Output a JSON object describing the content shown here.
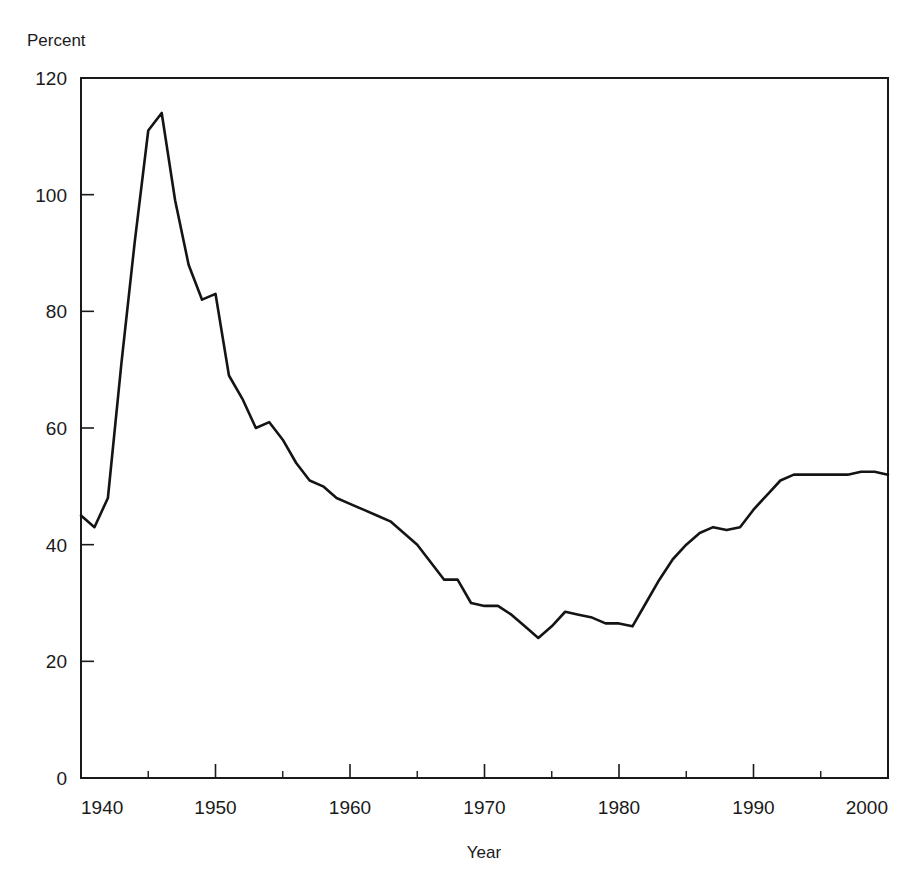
{
  "figure": {
    "ylabel_top": "Percent",
    "xlabel": "Year",
    "background_color": "#ffffff",
    "line_color": "#141414",
    "axis_color": "#1a1a1a"
  },
  "chart_data": {
    "type": "line",
    "title": "",
    "subtitle": "",
    "xlabel": "Year",
    "ylabel": "Percent",
    "ylabel_position": "above-axis-top-left",
    "xlim": [
      1940,
      2000
    ],
    "ylim": [
      0,
      120
    ],
    "ytick_labels": [
      "0",
      "20",
      "40",
      "60",
      "80",
      "100",
      "120"
    ],
    "yticks": [
      0,
      20,
      40,
      60,
      80,
      100,
      120
    ],
    "xtick_labels": [
      "1940",
      "1950",
      "1960",
      "1970",
      "1980",
      "1990",
      "2000"
    ],
    "xticks": [
      1940,
      1950,
      1960,
      1970,
      1980,
      1990,
      2000
    ],
    "xticks_minor": [
      1945,
      1955,
      1965,
      1975,
      1985,
      1995
    ],
    "grid": false,
    "legend": false,
    "legend_position": "none",
    "annotations": [],
    "series": [
      {
        "name": "Percent",
        "x": [
          1940,
          1941,
          1942,
          1943,
          1944,
          1945,
          1946,
          1947,
          1948,
          1949,
          1950,
          1951,
          1952,
          1953,
          1954,
          1955,
          1956,
          1957,
          1958,
          1959,
          1960,
          1961,
          1962,
          1963,
          1964,
          1965,
          1966,
          1967,
          1968,
          1969,
          1970,
          1971,
          1972,
          1973,
          1974,
          1975,
          1976,
          1977,
          1978,
          1979,
          1980,
          1981,
          1982,
          1983,
          1984,
          1985,
          1986,
          1987,
          1988,
          1989,
          1990,
          1991,
          1992,
          1993,
          1994,
          1995,
          1996,
          1997,
          1998,
          1999,
          2000
        ],
        "values": [
          45,
          43,
          48,
          71,
          92,
          111,
          114,
          99,
          88,
          82,
          83,
          69,
          65,
          60,
          61,
          58,
          54,
          51,
          50,
          48,
          47,
          46,
          45,
          44,
          42,
          40,
          37,
          34,
          34,
          30,
          29.5,
          29.5,
          28,
          26,
          24,
          26,
          28.5,
          28,
          27.5,
          26.5,
          26.5,
          26,
          30,
          34,
          37.5,
          40,
          42,
          43,
          42.5,
          43,
          46,
          48.5,
          51,
          52,
          52,
          52,
          52,
          52,
          52.5,
          52.5,
          52
        ]
      }
    ]
  }
}
